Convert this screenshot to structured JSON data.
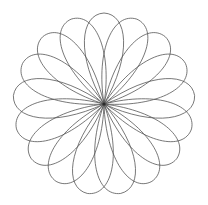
{
  "canvas": {
    "width": 208,
    "height": 205,
    "background_color": "#ffffff"
  },
  "figure": {
    "name": "rosette-petal-rosette",
    "kind": "geometric-line-drawing",
    "center_x": 104,
    "center_y": 104,
    "outer_radius": 91,
    "petal_count": 17,
    "petal_half_width_deg": 30,
    "petal_tip_bulge": 1.0,
    "rotation_offset_deg": -90,
    "stroke_color": "#555555",
    "stroke_width": 0.8,
    "fill": "none"
  },
  "chart_data": {
    "type": "scatter",
    "title": "",
    "xlabel": "",
    "ylabel": "",
    "grid": false,
    "legend": false,
    "xlim": [
      13,
      195
    ],
    "ylim": [
      12,
      190
    ],
    "note": "Parametric rosette: 17 teardrop loops sharing one vertex at (104,104), each reaching radius 91"
  }
}
